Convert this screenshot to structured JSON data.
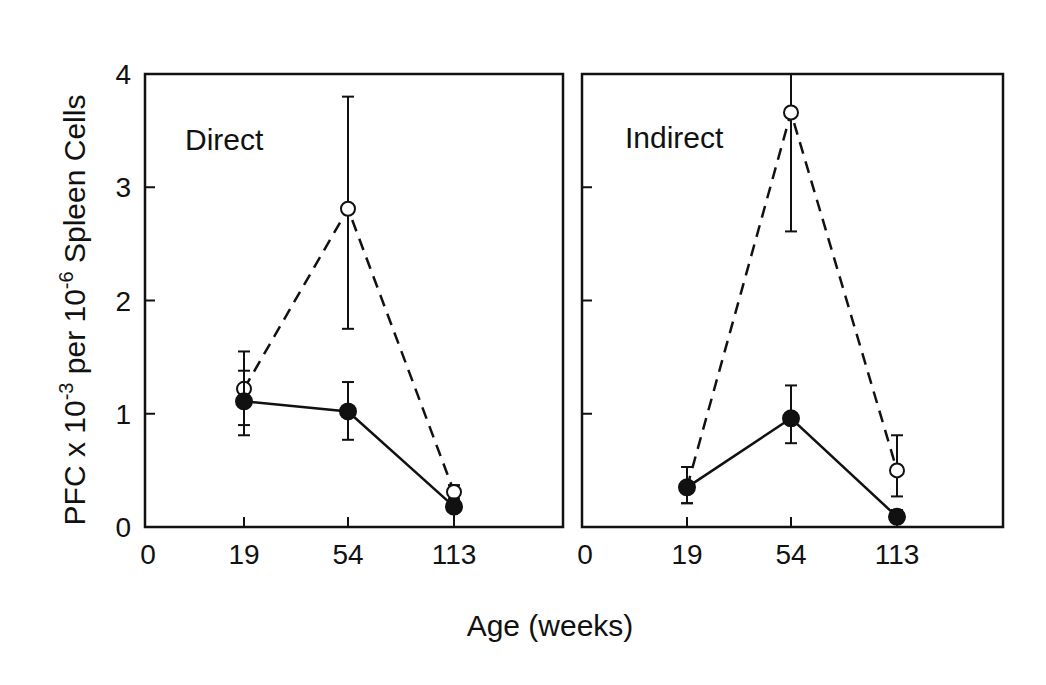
{
  "chart_data": [
    {
      "type": "line",
      "panel_label": "Direct",
      "categories": [
        "19",
        "54",
        "113"
      ],
      "origin_label": "0",
      "ylim": [
        0,
        4
      ],
      "yticks": [
        "0",
        "1",
        "2",
        "3",
        "4"
      ],
      "series": [
        {
          "name": "open",
          "marker": "open-circle",
          "line_style": "dashed",
          "values": [
            1.22,
            2.81,
            0.31
          ],
          "err_low": [
            0.9,
            1.75,
            0.25
          ],
          "err_high": [
            1.55,
            3.8,
            0.37
          ]
        },
        {
          "name": "filled",
          "marker": "filled-circle",
          "line_style": "solid",
          "values": [
            1.11,
            1.02,
            0.18
          ],
          "err_low": [
            0.81,
            0.77,
            0.0
          ],
          "err_high": [
            1.38,
            1.28,
            0.25
          ]
        }
      ]
    },
    {
      "type": "line",
      "panel_label": "Indirect",
      "categories": [
        "19",
        "54",
        "113"
      ],
      "origin_label": "0",
      "ylim": [
        0,
        4
      ],
      "yticks": [
        "0",
        "1",
        "2",
        "3",
        "4"
      ],
      "series": [
        {
          "name": "open",
          "marker": "open-circle",
          "line_style": "dashed",
          "values": [
            0.35,
            3.66,
            0.5
          ],
          "err_low": [
            0.21,
            2.61,
            0.27
          ],
          "err_high": [
            0.53,
            4.0,
            0.81
          ]
        },
        {
          "name": "filled",
          "marker": "filled-circle",
          "line_style": "solid",
          "values": [
            0.35,
            0.96,
            0.09
          ],
          "err_low": [
            0.21,
            0.74,
            0.0
          ],
          "err_high": [
            0.53,
            1.25,
            0.15
          ]
        }
      ]
    }
  ],
  "axes": {
    "ylabel_main": "PFC x 10",
    "ylabel_exp1": "-3",
    "ylabel_mid": " per 10",
    "ylabel_exp2": "-6",
    "ylabel_end": " Spleen Cells",
    "xlabel": "Age (weeks)"
  }
}
